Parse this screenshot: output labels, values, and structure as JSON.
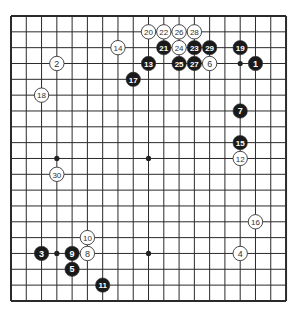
{
  "board": {
    "size": 19,
    "origin_x": 11,
    "origin_y": 16,
    "spacing_x": 15.28,
    "spacing_y": 15.83,
    "line_color": "#2a2a2a",
    "star_points": [
      [
        3,
        3
      ],
      [
        9,
        3
      ],
      [
        15,
        3
      ],
      [
        3,
        9
      ],
      [
        9,
        9
      ],
      [
        15,
        9
      ],
      [
        3,
        15
      ],
      [
        9,
        15
      ],
      [
        15,
        15
      ]
    ],
    "visible_star_points": [
      [
        15,
        3
      ],
      [
        3,
        9
      ],
      [
        9,
        9
      ],
      [
        3,
        15
      ],
      [
        9,
        15
      ]
    ]
  },
  "stones": [
    {
      "n": "1",
      "color": "black",
      "col": 16,
      "row": 3
    },
    {
      "n": "2",
      "color": "white",
      "col": 3,
      "row": 3
    },
    {
      "n": "3",
      "color": "black",
      "col": 2,
      "row": 15
    },
    {
      "n": "4",
      "color": "white",
      "col": 15,
      "row": 15
    },
    {
      "n": "5",
      "color": "black",
      "col": 4,
      "row": 16
    },
    {
      "n": "6",
      "color": "white",
      "col": 13,
      "row": 3
    },
    {
      "n": "7",
      "color": "black",
      "col": 15,
      "row": 6
    },
    {
      "n": "8",
      "color": "white",
      "col": 5,
      "row": 15
    },
    {
      "n": "9",
      "color": "black",
      "col": 4,
      "row": 15
    },
    {
      "n": "10",
      "color": "white",
      "col": 5,
      "row": 14
    },
    {
      "n": "11",
      "color": "black",
      "col": 6,
      "row": 17
    },
    {
      "n": "12",
      "color": "white",
      "col": 15,
      "row": 9
    },
    {
      "n": "13",
      "color": "black",
      "col": 9,
      "row": 3
    },
    {
      "n": "14",
      "color": "white",
      "col": 7,
      "row": 2
    },
    {
      "n": "15",
      "color": "black",
      "col": 15,
      "row": 8
    },
    {
      "n": "16",
      "color": "white",
      "col": 16,
      "row": 13
    },
    {
      "n": "17",
      "color": "black",
      "col": 8,
      "row": 4
    },
    {
      "n": "18",
      "color": "white",
      "col": 2,
      "row": 5
    },
    {
      "n": "19",
      "color": "black",
      "col": 15,
      "row": 2
    },
    {
      "n": "20",
      "color": "white",
      "col": 9,
      "row": 1
    },
    {
      "n": "21",
      "color": "black",
      "col": 10,
      "row": 2
    },
    {
      "n": "22",
      "color": "white",
      "col": 10,
      "row": 1
    },
    {
      "n": "23",
      "color": "black",
      "col": 12,
      "row": 2
    },
    {
      "n": "24",
      "color": "white",
      "col": 11,
      "row": 2
    },
    {
      "n": "25",
      "color": "black",
      "col": 11,
      "row": 3
    },
    {
      "n": "26",
      "color": "white",
      "col": 11,
      "row": 1
    },
    {
      "n": "27",
      "color": "black",
      "col": 12,
      "row": 3
    },
    {
      "n": "28",
      "color": "white",
      "col": 12,
      "row": 1
    },
    {
      "n": "29",
      "color": "black",
      "col": 13,
      "row": 2
    },
    {
      "n": "30",
      "color": "white",
      "col": 3,
      "row": 10
    }
  ]
}
